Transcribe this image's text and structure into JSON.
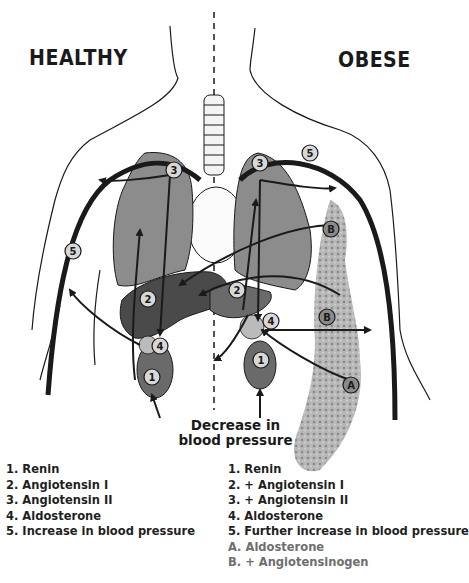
{
  "titles": {
    "healthy": "HEALTHY",
    "obese": "OBESE"
  },
  "caption": {
    "line1": "Decrease in",
    "line2": "blood pressure"
  },
  "markers": {
    "healthy": [
      "1",
      "2",
      "3",
      "4",
      "5"
    ],
    "obese": [
      "1",
      "2",
      "3",
      "4",
      "5",
      "A",
      "B",
      "B"
    ]
  },
  "legend": {
    "healthy": [
      "1. Renin",
      "2. Angiotensin I",
      "3. Angiotensin II",
      "4. Aldosterone",
      "5. Increase in blood pressure"
    ],
    "obese": [
      "1. Renin",
      "2. + Angiotensin I",
      "3. + Angiotensin II",
      "4. Aldosterone",
      "5. Further increase in blood pressure",
      "A. Aldosterone",
      "B. + Angiotensinogen"
    ]
  },
  "colors": {
    "ink": "#1a1a1a",
    "lung": "#8c8c8c",
    "liver": "#4a4a4a",
    "kidney": "#6a6a6a",
    "fat": "#a8a8a8",
    "marker_fill": "#d8d8d8",
    "legend_grey": "#6e6e6e"
  }
}
